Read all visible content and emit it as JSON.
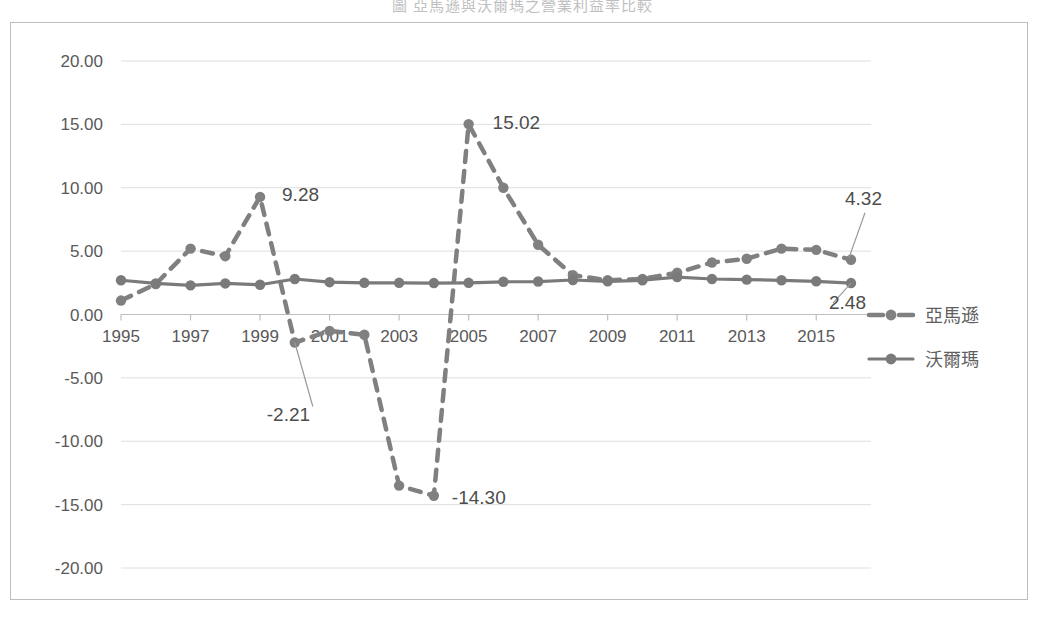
{
  "title": "圖       亞馬遜與沃爾瑪之營業利益率比較",
  "chart_data": {
    "type": "line",
    "title": "圖       亞馬遜與沃爾瑪之營業利益率比較",
    "xlabel": "",
    "ylabel": "",
    "ylim": [
      -20,
      20
    ],
    "ytick_step": 5,
    "ytick_labels": [
      "20.00",
      "15.00",
      "10.00",
      "5.00",
      "0.00",
      "-5.00",
      "-10.00",
      "-15.00",
      "-20.00"
    ],
    "ytick_values": [
      20,
      15,
      10,
      5,
      0,
      -5,
      -10,
      -15,
      -20
    ],
    "x": [
      1995,
      1996,
      1997,
      1998,
      1999,
      2000,
      2001,
      2002,
      2003,
      2004,
      2005,
      2006,
      2007,
      2008,
      2009,
      2010,
      2011,
      2012,
      2013,
      2014,
      2015,
      2016
    ],
    "xtick_labels": [
      "1995",
      "1997",
      "1999",
      "2001",
      "2003",
      "2005",
      "2007",
      "2009",
      "2011",
      "2013",
      "2015"
    ],
    "xtick_values": [
      1995,
      1997,
      1999,
      2001,
      2003,
      2005,
      2007,
      2009,
      2011,
      2013,
      2015
    ],
    "grid": "horizontal",
    "legend_position": "right",
    "series": [
      {
        "name": "亞馬遜",
        "style": "dashed",
        "color": "#808080",
        "marker": "circle",
        "values": [
          1.1,
          2.4,
          5.2,
          4.6,
          9.28,
          -2.21,
          -1.3,
          -1.6,
          -13.5,
          -14.3,
          15.02,
          10.0,
          5.5,
          3.1,
          2.7,
          2.8,
          3.3,
          4.1,
          4.4,
          5.2,
          5.1,
          4.32
        ]
      },
      {
        "name": "沃爾瑪",
        "style": "solid",
        "color": "#7a7a7a",
        "marker": "circle",
        "values": [
          2.7,
          2.45,
          2.3,
          2.45,
          2.35,
          2.8,
          2.55,
          2.5,
          2.5,
          2.48,
          2.5,
          2.58,
          2.6,
          2.72,
          2.62,
          2.7,
          2.95,
          2.8,
          2.75,
          2.7,
          2.62,
          2.48
        ]
      }
    ],
    "annotations": [
      {
        "text": "9.28",
        "year": 1999,
        "value": 9.28,
        "leader": false
      },
      {
        "text": "15.02",
        "year": 2005,
        "value": 15.02,
        "leader": false
      },
      {
        "text": "-2.21",
        "year": 2000,
        "value": -2.21,
        "leader": true
      },
      {
        "text": "-14.30",
        "year": 2004,
        "value": -14.3,
        "leader": false
      },
      {
        "text": "4.32",
        "year": 2016,
        "value": 4.32,
        "leader": true
      },
      {
        "text": "2.48",
        "year": 2016,
        "value": 2.48,
        "leader": true
      }
    ]
  },
  "legend": {
    "items": [
      {
        "label": "亞馬遜",
        "style": "dashed"
      },
      {
        "label": "沃爾瑪",
        "style": "solid"
      }
    ]
  }
}
